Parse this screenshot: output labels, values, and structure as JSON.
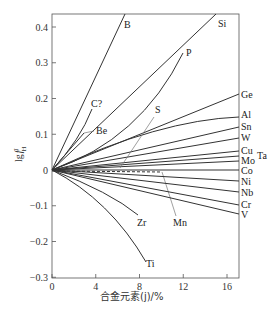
{
  "chart_data": {
    "type": "line",
    "title": "",
    "xlabel": "合金元素(j)/%",
    "ylabel": "lg f_H^j",
    "xlim": [
      0,
      17
    ],
    "ylim": [
      -0.3,
      0.44
    ],
    "x_ticks": [
      0,
      4,
      8,
      12,
      16
    ],
    "y_ticks": [
      0.4,
      0.3,
      0.2,
      0.1,
      0,
      -0.1,
      -0.2,
      -0.3
    ],
    "y_tick_labels": [
      "0.4",
      "0.3",
      "0.2",
      "0.1",
      "0",
      "−0.1",
      "−0.2",
      "−0.3"
    ],
    "grid": false,
    "legend": "inline labels at curve ends",
    "series": [
      {
        "name": "B",
        "x": [
          0,
          6.8
        ],
        "y": [
          0,
          0.43
        ]
      },
      {
        "name": "Si",
        "x": [
          0,
          15.0
        ],
        "y": [
          0,
          0.43
        ]
      },
      {
        "name": "P",
        "x": [
          0,
          6,
          10.5
        ],
        "y": [
          0,
          0.12,
          0.3
        ]
      },
      {
        "name": "C?",
        "x": [
          0,
          2.5,
          3.6
        ],
        "y": [
          0,
          0.09,
          0.17
        ]
      },
      {
        "name": "Be",
        "x": [
          0,
          2.8
        ],
        "y": [
          0,
          0.1
        ]
      },
      {
        "name": "S",
        "x": [
          0,
          9.8
        ],
        "y": [
          0,
          0.03
        ]
      },
      {
        "name": "Ge",
        "x": [
          0,
          16.7
        ],
        "y": [
          0,
          0.21
        ]
      },
      {
        "name": "Al",
        "x": [
          0,
          10,
          16.7
        ],
        "y": [
          0,
          0.1,
          0.14
        ]
      },
      {
        "name": "Sn",
        "x": [
          0,
          16.7
        ],
        "y": [
          0,
          0.12
        ]
      },
      {
        "name": "W",
        "x": [
          0,
          16.7
        ],
        "y": [
          0,
          0.09
        ]
      },
      {
        "name": "Cu",
        "x": [
          0,
          16.7
        ],
        "y": [
          0,
          0.05
        ]
      },
      {
        "name": "Ta",
        "x": [
          0,
          16.7
        ],
        "y": [
          0,
          0.035
        ]
      },
      {
        "name": "Mo",
        "x": [
          0,
          16.7
        ],
        "y": [
          0,
          0.025
        ]
      },
      {
        "name": "Co",
        "x": [
          0,
          16.7
        ],
        "y": [
          0,
          0.0
        ]
      },
      {
        "name": "Mn",
        "x": [
          0,
          11.0
        ],
        "y": [
          0,
          -0.005
        ],
        "style": "dashed"
      },
      {
        "name": "Ni",
        "x": [
          0,
          16.7
        ],
        "y": [
          0,
          -0.03
        ]
      },
      {
        "name": "Nb",
        "x": [
          0,
          16.7
        ],
        "y": [
          0,
          -0.06
        ]
      },
      {
        "name": "Cr",
        "x": [
          0,
          16.7
        ],
        "y": [
          0,
          -0.095
        ]
      },
      {
        "name": "V",
        "x": [
          0,
          16.7
        ],
        "y": [
          0,
          -0.12
        ]
      },
      {
        "name": "Zr",
        "x": [
          0,
          5,
          8.1
        ],
        "y": [
          0,
          -0.07,
          -0.14
        ]
      },
      {
        "name": "Ti",
        "x": [
          0,
          5,
          8.8
        ],
        "y": [
          0,
          -0.12,
          -0.26
        ]
      }
    ],
    "annotations": [
      {
        "text": "B",
        "x": 124,
        "y": 28
      },
      {
        "text": "Si",
        "x": 218,
        "y": 27
      },
      {
        "text": "P",
        "x": 186,
        "y": 56
      },
      {
        "text": "C?",
        "x": 91,
        "y": 107
      },
      {
        "text": "Be",
        "x": 96,
        "y": 134
      },
      {
        "text": "S",
        "x": 155,
        "y": 113
      },
      {
        "text": "Ge",
        "x": 241,
        "y": 98
      },
      {
        "text": "Al",
        "x": 241,
        "y": 118
      },
      {
        "text": "Sn",
        "x": 241,
        "y": 130
      },
      {
        "text": "W",
        "x": 241,
        "y": 141
      },
      {
        "text": "Cu",
        "x": 241,
        "y": 154
      },
      {
        "text": "Ta",
        "x": 257,
        "y": 159
      },
      {
        "text": "Mo",
        "x": 241,
        "y": 164
      },
      {
        "text": "Co",
        "x": 241,
        "y": 174
      },
      {
        "text": "Ni",
        "x": 241,
        "y": 185
      },
      {
        "text": "Nb",
        "x": 241,
        "y": 196
      },
      {
        "text": "Cr",
        "x": 241,
        "y": 208
      },
      {
        "text": "V",
        "x": 241,
        "y": 218
      },
      {
        "text": "Zr",
        "x": 137,
        "y": 226
      },
      {
        "text": "Mn",
        "x": 173,
        "y": 226
      },
      {
        "text": "Ti",
        "x": 146,
        "y": 267
      }
    ]
  }
}
